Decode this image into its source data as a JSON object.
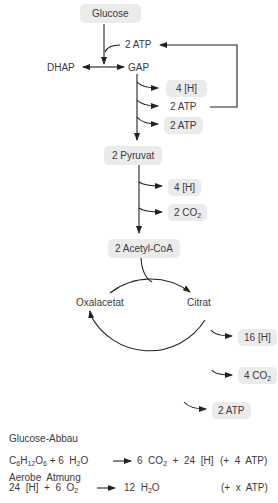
{
  "nodes": {
    "glucose": "Glucose",
    "dhap": "DHAP",
    "gap": "GAP",
    "atp_in": "2  ATP",
    "h4_glyc": "4  [H]",
    "atp_glyc1": "2    ATP",
    "atp_glyc2": "2    ATP",
    "pyruvat": "2     Pyruvat",
    "h4_pyr": "4  [H]",
    "co2_pyr_num": "2  CO",
    "co2_pyr_sub": "2",
    "acetyl": "2  Acetyl-CoA",
    "oxalacetat": "Oxalacetat",
    "citrat": "Citrat",
    "h16": "16  [H]",
    "co2_cyc_num": "4  CO",
    "co2_cyc_sub": "2",
    "atp_cyc": "2  ATP"
  },
  "equations": {
    "glucose_abbau": {
      "title": "Glucose-Abbau",
      "lhs_c": "C",
      "lhs_c_sub": "6",
      "lhs_h": "H",
      "lhs_h_sub": "12",
      "lhs_o": "O",
      "lhs_o_sub": "6",
      "plus_water": " + 6  H",
      "water_sub": "2",
      "water_o": "O",
      "rhs": "6  CO",
      "rhs_sub": "2",
      "rhs_rest": "  +  24  [H]",
      "note": "(+  4  ATP)"
    },
    "aerobe_atmung": {
      "title": "Aerobe  Atmung",
      "lhs": "24  [H]  +  6  O",
      "lhs_sub": "2",
      "rhs": "12  H",
      "rhs_sub": "2",
      "rhs_o": "O",
      "note": "(+  x  ATP)"
    }
  },
  "colors": {
    "box_fill": "#ebebeb",
    "line": "#222222",
    "text": "#3a3a3a"
  }
}
